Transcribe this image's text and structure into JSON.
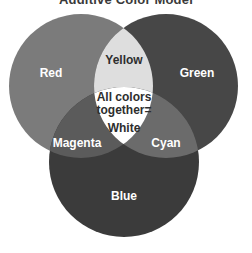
{
  "title": "Additive Color Model",
  "circles": {
    "red": {
      "label": "Red",
      "cx": 81,
      "cy": 86,
      "r": 72,
      "fill": "#7b7b7b"
    },
    "green": {
      "label": "Green",
      "cx": 166,
      "cy": 86,
      "r": 72,
      "fill": "#474747"
    },
    "blue": {
      "label": "Blue",
      "cx": 124,
      "cy": 162,
      "r": 75,
      "fill": "#3b3b3b"
    }
  },
  "overlaps": {
    "yellow": {
      "label": "Yellow",
      "fill": "#dedede"
    },
    "magenta": {
      "label": "Magenta",
      "fill": "#5b5b5b"
    },
    "cyan": {
      "label": "Cyan",
      "fill": "#6b6b6b"
    },
    "white": {
      "line1": "All colors",
      "line2": "together=",
      "line3": "White",
      "fill": "#ffffff"
    }
  },
  "colors": {
    "label_light": "#ffffff",
    "label_dark": "#2e2e2e"
  }
}
